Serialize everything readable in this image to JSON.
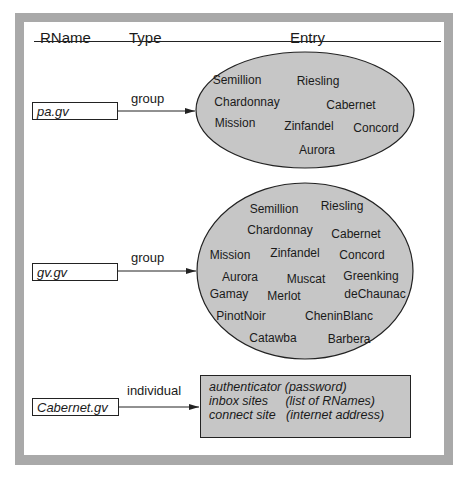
{
  "header": {
    "col_rname": "RName",
    "col_type": "Type",
    "col_entry": "Entry"
  },
  "colors": {
    "frame": "#a9a9a9",
    "fill": "#c6c6c6",
    "stroke": "#222222"
  },
  "rows": [
    {
      "rname": "pa.gv",
      "type": "group",
      "members": [
        "Semillion",
        "Riesling",
        "Chardonnay",
        "Cabernet",
        "Mission",
        "Zinfandel",
        "Concord",
        "Aurora"
      ]
    },
    {
      "rname": "gv.gv",
      "type": "group",
      "members": [
        "Semillion",
        "Riesling",
        "Chardonnay",
        "Cabernet",
        "Mission",
        "Zinfandel",
        "Concord",
        "Aurora",
        "Muscat",
        "Greenking",
        "Gamay",
        "Merlot",
        "deChaunac",
        "PinotNoir",
        "CheninBlanc",
        "Catawba",
        "Barbera"
      ]
    },
    {
      "rname": "Cabernet.gv",
      "type": "individual",
      "fields": [
        "authenticator (password)",
        "inbox sites     (list of RNames)",
        "connect site   (internet address)"
      ]
    }
  ]
}
